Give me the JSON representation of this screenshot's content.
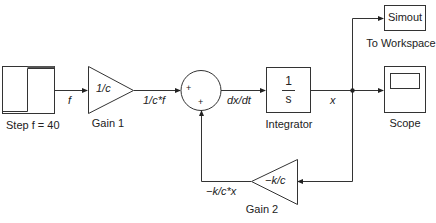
{
  "blocks": {
    "step": {
      "label": "Step f = 40"
    },
    "gain1": {
      "value": "1/c",
      "label": "Gain 1"
    },
    "sum": {
      "signs": [
        "+",
        "+"
      ]
    },
    "integrator": {
      "numerator": "1",
      "denominator": "s",
      "label": "Integrator"
    },
    "to_workspace": {
      "value": "Simout",
      "label": "To Workspace"
    },
    "scope": {
      "label": "Scope"
    },
    "gain2": {
      "value": "−k/c",
      "label": "Gain 2"
    }
  },
  "signals": {
    "f": "f",
    "gain1_out": "1/c*f",
    "sum_out": "dx/dt",
    "x": "x",
    "feedback": "−k/c*x"
  },
  "colors": {
    "stroke": "#333333",
    "background": "#ffffff"
  }
}
